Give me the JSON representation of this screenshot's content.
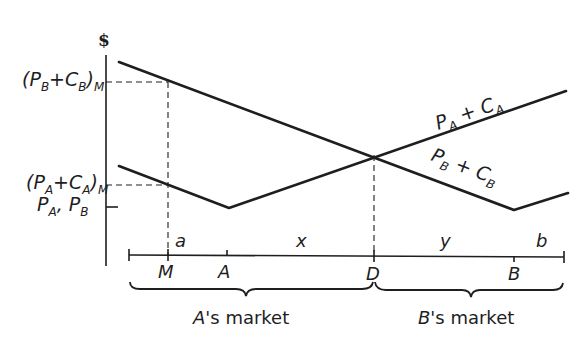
{
  "diagram": {
    "type": "spatial-price-competition",
    "y_axis_symbol": "$",
    "y_labels": {
      "pb_cb_m": {
        "open": "(P",
        "sub1": "B",
        "plus": "+C",
        "sub2": "B",
        "close": ")",
        "sub3": "M"
      },
      "pa_ca_m": {
        "open": "(P",
        "sub1": "A",
        "plus": "+C",
        "sub2": "A",
        "close": ")",
        "sub3": "M"
      },
      "pa_pb": {
        "p1": "P",
        "s1": "A",
        "comma": ", P",
        "s2": "B"
      }
    },
    "curve_labels": {
      "pa_ca": {
        "p": "P",
        "s1": "A",
        "plus": " + C",
        "s2": "A"
      },
      "pb_cb": {
        "p": "P",
        "s1": "B",
        "plus": " + C",
        "s2": "B"
      }
    },
    "segment_labels": {
      "a": "a",
      "x": "x",
      "y": "y",
      "b": "b"
    },
    "point_labels": {
      "M": "M",
      "A": "A",
      "D": "D",
      "B": "B"
    },
    "market_labels": {
      "a_market": {
        "firm": "A",
        "rest": "'s market"
      },
      "b_market": {
        "firm": "B",
        "rest": "'s market"
      }
    },
    "line_color": "#1e1e1e",
    "background": "#ffffff"
  }
}
